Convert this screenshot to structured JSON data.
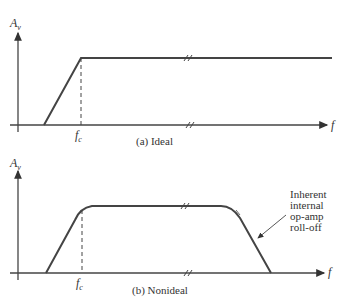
{
  "panels": [
    {
      "id": "ideal",
      "caption": "(a) Ideal",
      "y_label": "A",
      "y_label_sub": "v",
      "x_label": "f",
      "fc_label": "f",
      "fc_label_sub": "c"
    },
    {
      "id": "nonideal",
      "caption": "(b) Nonideal",
      "y_label": "A",
      "y_label_sub": "v",
      "x_label": "f",
      "fc_label": "f",
      "fc_label_sub": "c",
      "annotation": [
        "Inherent",
        "internal",
        "op-amp",
        "roll-off"
      ]
    }
  ],
  "colors": {
    "line": "#444444",
    "text": "#333333"
  }
}
